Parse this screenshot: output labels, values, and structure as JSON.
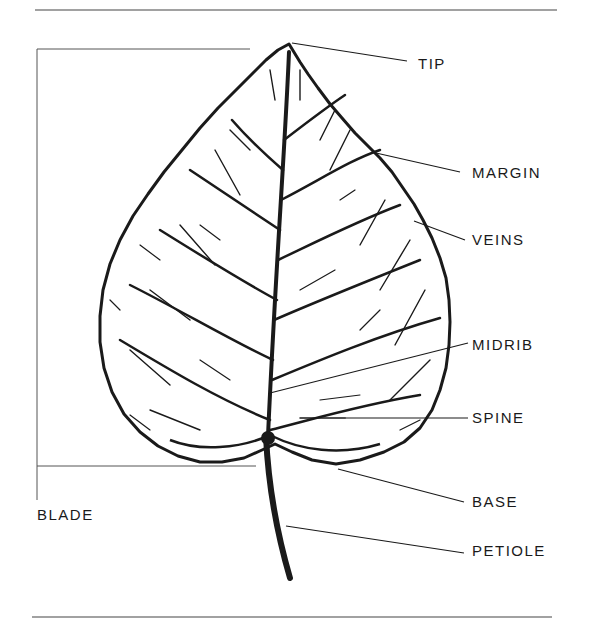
{
  "diagram": {
    "colors": {
      "ink": "#1a1a1a",
      "rule": "#444444",
      "background": "#ffffff"
    },
    "labels": {
      "tip": "TIP",
      "margin": "MARGIN",
      "veins": "VEINS",
      "midrib": "MIDRIB",
      "spine": "SPINE",
      "base": "BASE",
      "petiole": "PETIOLE",
      "blade": "BLADE"
    },
    "parts": [
      {
        "id": "tip",
        "label": "TIP",
        "anchor": [
          289,
          44
        ],
        "label_pos": [
          418,
          63
        ]
      },
      {
        "id": "margin",
        "label": "MARGIN",
        "anchor": [
          376,
          153
        ],
        "label_pos": [
          472,
          166
        ]
      },
      {
        "id": "veins",
        "label": "VEINS",
        "anchor": [
          414,
          221
        ],
        "label_pos": [
          472,
          233
        ]
      },
      {
        "id": "midrib",
        "label": "MIDRIB",
        "anchor": [
          270,
          393
        ],
        "label_pos": [
          472,
          338
        ]
      },
      {
        "id": "spine",
        "label": "SPINE",
        "anchor": [
          345,
          418
        ],
        "label_pos": [
          472,
          410
        ]
      },
      {
        "id": "base",
        "label": "BASE",
        "anchor": [
          338,
          469
        ],
        "label_pos": [
          472,
          494
        ]
      },
      {
        "id": "petiole",
        "label": "PETIOLE",
        "anchor": [
          286,
          526
        ],
        "label_pos": [
          472,
          544
        ]
      },
      {
        "id": "blade",
        "label": "BLADE",
        "anchor": [
          37,
          49
        ],
        "label_pos": [
          37,
          507
        ]
      }
    ]
  }
}
